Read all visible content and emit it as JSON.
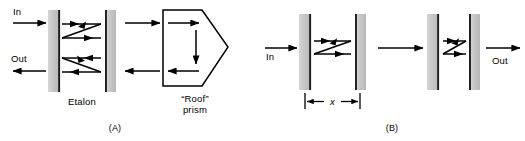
{
  "figure": {
    "type": "optical-diagram",
    "background_color": "#ffffff",
    "stroke_color": "#000000",
    "plate_fill_color": "#c8c8c8",
    "plate_edge_color": "#1a1a1a",
    "width": 525,
    "height": 141
  },
  "panel_a": {
    "tag": "(A)",
    "in_label": "In",
    "out_label": "Out",
    "etalon_label": "Etalon",
    "prism_label_line1": "“Roof”",
    "prism_label_line2": "prism",
    "plates": [
      {
        "name": "etalon-plate-left",
        "x": 48,
        "y": 10,
        "width": 11,
        "height": 82,
        "edge_side": "right"
      },
      {
        "name": "etalon-plate-right",
        "x": 105,
        "y": 10,
        "width": 11,
        "height": 82,
        "edge_side": "left"
      }
    ],
    "rays": [
      {
        "name": "input-ray",
        "direction": "right",
        "y": 23
      },
      {
        "name": "output-ray",
        "direction": "left",
        "y": 71
      },
      {
        "name": "cavity-upper-zigzag",
        "direction": "right"
      },
      {
        "name": "cavity-lower-zigzag",
        "direction": "left"
      },
      {
        "name": "prism-entry-ray",
        "direction": "right",
        "y": 23
      },
      {
        "name": "prism-return-ray",
        "direction": "left",
        "y": 71
      },
      {
        "name": "prism-internal-top",
        "direction": "right",
        "y": 23
      },
      {
        "name": "prism-internal-down",
        "direction": "down"
      },
      {
        "name": "prism-internal-bottom",
        "direction": "left",
        "y": 71
      }
    ],
    "prism": {
      "name": "roof-prism",
      "shape": "pentagon",
      "apex_side": "right"
    }
  },
  "panel_b": {
    "tag": "(B)",
    "in_label": "In",
    "out_label": "Out",
    "dimension_label": "x",
    "plates": [
      {
        "name": "plate-1",
        "x": 37,
        "y": 14,
        "width": 11,
        "height": 76,
        "edge_side": "right"
      },
      {
        "name": "plate-2",
        "x": 93,
        "y": 14,
        "width": 11,
        "height": 76,
        "edge_side": "left"
      },
      {
        "name": "plate-3",
        "x": 165,
        "y": 14,
        "width": 11,
        "height": 76,
        "edge_side": "right"
      },
      {
        "name": "plate-4",
        "x": 207,
        "y": 14,
        "width": 11,
        "height": 76,
        "edge_side": "left"
      }
    ],
    "rays": [
      {
        "name": "input-ray",
        "direction": "right",
        "y": 48
      },
      {
        "name": "cavity-1-zigzag",
        "direction": "right"
      },
      {
        "name": "interstage-ray",
        "direction": "right",
        "y": 48
      },
      {
        "name": "cavity-2-zigzag",
        "direction": "right"
      },
      {
        "name": "output-ray",
        "direction": "right",
        "y": 48
      }
    ],
    "dimension": {
      "name": "cavity-spacing-dimension",
      "from_plate": "plate-1",
      "to_plate": "plate-2",
      "label": "x"
    }
  }
}
